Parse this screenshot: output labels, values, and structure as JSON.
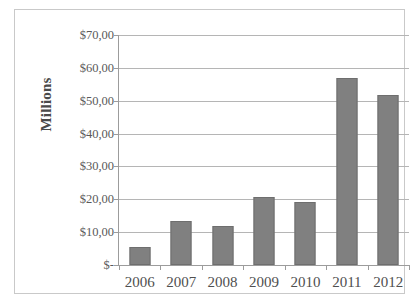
{
  "chart_data": {
    "type": "bar",
    "title": "",
    "xlabel": "",
    "ylabel": "Millions",
    "categories": [
      "2006",
      "2007",
      "2008",
      "2009",
      "2010",
      "2011",
      "2012"
    ],
    "values": [
      5.5,
      13.5,
      12.0,
      20.8,
      19.3,
      56.8,
      51.7
    ],
    "ylim": [
      0,
      70
    ],
    "ytick_values": [
      70,
      60,
      50,
      40,
      30,
      20,
      10,
      0
    ],
    "ytick_labels": [
      "$70,00",
      "$60,00",
      "$50,00",
      "$40,00",
      "$30,00",
      "$20,00",
      "$10,00",
      "$-"
    ],
    "grid": true,
    "legend": false,
    "legend_position": "none",
    "bar_color": "#808080",
    "bar_border_color": "#6e6e6e",
    "gridline_color": "#b5b5b5",
    "axis_color": "#9c9c9c",
    "series": [
      {
        "name": "Millions",
        "values": [
          5.5,
          13.5,
          12.0,
          20.8,
          19.3,
          56.8,
          51.7
        ]
      }
    ]
  },
  "cutoff_title_text": "figure above the chart frame, cropped"
}
